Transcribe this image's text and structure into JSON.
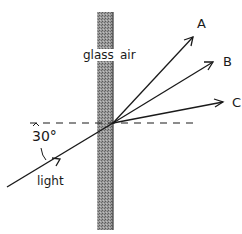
{
  "diagram": {
    "media": {
      "glass_label": "glass",
      "air_label": "air"
    },
    "incident": {
      "label": "light",
      "angle_label": "30°"
    },
    "rays": [
      {
        "label": "A"
      },
      {
        "label": "B"
      },
      {
        "label": "C"
      }
    ],
    "colors": {
      "ink": "#1a1a1a",
      "glass_fill": "#8a8a8a"
    }
  }
}
